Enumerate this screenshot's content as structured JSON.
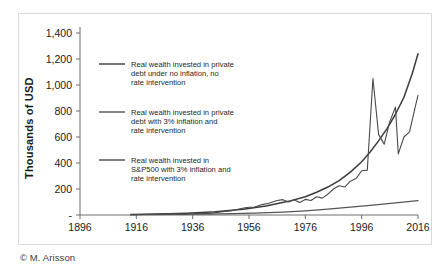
{
  "caption": "© M. Arisson",
  "chart_data": {
    "type": "line",
    "title": "",
    "xlabel": "",
    "ylabel": "Thousands of USD",
    "xlim": [
      1896,
      2016
    ],
    "ylim": [
      0,
      1400
    ],
    "grid": false,
    "legend_position": "inside-upper-left",
    "xticks": [
      "1896",
      "1916",
      "1936",
      "1956",
      "1976",
      "1996",
      "2016"
    ],
    "yticks": [
      "-",
      "200",
      "400",
      "600",
      "800",
      "1,000",
      "1,200",
      "1,400"
    ],
    "ytick_values": [
      0,
      200,
      400,
      600,
      800,
      1000,
      1200,
      1400
    ],
    "xtick_values": [
      1896,
      1916,
      1936,
      1956,
      1976,
      1996,
      2016
    ],
    "series": [
      {
        "name": "Real wealth invested in private debt under no inflation, no rate intervention",
        "color": "#3c3c3c",
        "x": [
          1914,
          1924,
          1934,
          1944,
          1954,
          1962,
          1970,
          1976,
          1980,
          1984,
          1988,
          1992,
          1996,
          1999,
          2002,
          2005,
          2008,
          2011,
          2014,
          2016
        ],
        "values": [
          3,
          7,
          14,
          25,
          45,
          70,
          105,
          140,
          175,
          215,
          265,
          330,
          410,
          485,
          570,
          665,
          775,
          905,
          1090,
          1240
        ]
      },
      {
        "name": "Real wealth invested in private debt with 3% inflation and rate intervention",
        "color": "#555555",
        "x": [
          1914,
          1930,
          1946,
          1958,
          1968,
          1976,
          1984,
          1992,
          2000,
          2008,
          2016
        ],
        "values": [
          2,
          4,
          8,
          14,
          22,
          32,
          45,
          60,
          76,
          94,
          110
        ]
      },
      {
        "name": "Real wealth invested in S&P500 with 3% inflation and rate intervention",
        "color": "#4a4a4a",
        "x": [
          1914,
          1922,
          1929,
          1932,
          1937,
          1942,
          1946,
          1950,
          1955,
          1958,
          1961,
          1963,
          1966,
          1968,
          1970,
          1972,
          1974,
          1976,
          1978,
          1980,
          1982,
          1984,
          1986,
          1988,
          1990,
          1992,
          1994,
          1996,
          1998,
          2000,
          2002,
          2004,
          2006,
          2008,
          2009,
          2011,
          2013,
          2015,
          2016
        ],
        "values": [
          2,
          6,
          12,
          6,
          14,
          12,
          24,
          34,
          58,
          62,
          82,
          90,
          112,
          118,
          100,
          118,
          96,
          120,
          112,
          140,
          130,
          160,
          200,
          225,
          215,
          260,
          280,
          340,
          345,
          1050,
          620,
          545,
          720,
          830,
          470,
          600,
          640,
          830,
          920
        ]
      }
    ],
    "legend": [
      {
        "line1": "Real wealth invested in private",
        "line2": "debt under no inflation, no",
        "line3": "rate intervention"
      },
      {
        "line1": "Real wealth invested in private",
        "line2": "debt with 3% inflation and",
        "line3": "rate intervention"
      },
      {
        "line1": "Real wealth invested in",
        "line2": "S&P500 with 3% inflation and",
        "line3": "rate intervention"
      }
    ]
  }
}
